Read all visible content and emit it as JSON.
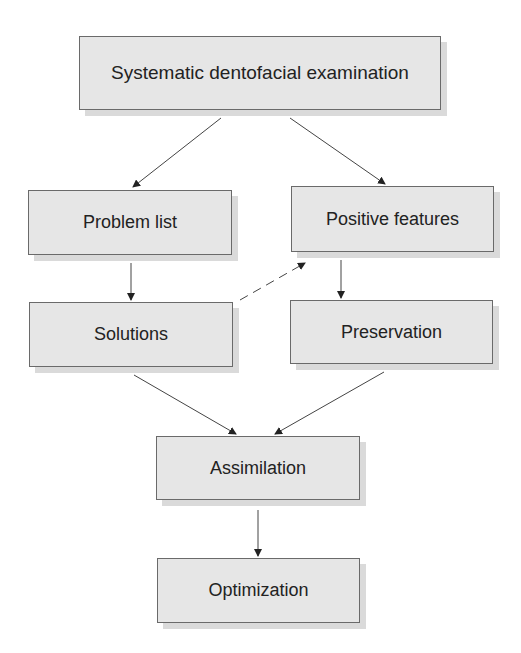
{
  "diagram": {
    "nodes": [
      {
        "id": "exam",
        "label": "Systematic dentofacial examination",
        "x": 79,
        "y": 36,
        "w": 362,
        "h": 74
      },
      {
        "id": "problems",
        "label": "Problem list",
        "x": 28,
        "y": 190,
        "w": 204,
        "h": 65
      },
      {
        "id": "positives",
        "label": "Positive features",
        "x": 291,
        "y": 186,
        "w": 203,
        "h": 66
      },
      {
        "id": "solutions",
        "label": "Solutions",
        "x": 29,
        "y": 302,
        "w": 204,
        "h": 65
      },
      {
        "id": "preservation",
        "label": "Preservation",
        "x": 290,
        "y": 300,
        "w": 203,
        "h": 64
      },
      {
        "id": "assimilation",
        "label": "Assimilation",
        "x": 156,
        "y": 436,
        "w": 204,
        "h": 64
      },
      {
        "id": "optimization",
        "label": "Optimization",
        "x": 157,
        "y": 558,
        "w": 203,
        "h": 65
      }
    ],
    "edges": [
      {
        "from": "exam",
        "to": "problems",
        "style": "solid"
      },
      {
        "from": "exam",
        "to": "positives",
        "style": "solid"
      },
      {
        "from": "problems",
        "to": "solutions",
        "style": "solid"
      },
      {
        "from": "positives",
        "to": "preservation",
        "style": "solid"
      },
      {
        "from": "solutions",
        "to": "positives",
        "style": "dashed"
      },
      {
        "from": "solutions",
        "to": "assimilation",
        "style": "solid"
      },
      {
        "from": "preservation",
        "to": "assimilation",
        "style": "solid"
      },
      {
        "from": "assimilation",
        "to": "optimization",
        "style": "solid"
      }
    ]
  }
}
